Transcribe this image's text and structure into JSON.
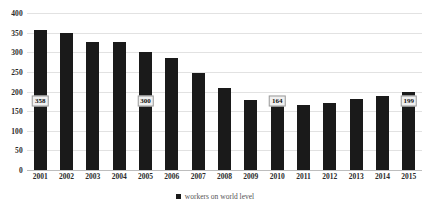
{
  "chart_data": {
    "type": "bar",
    "title": "",
    "subtitle": "",
    "xlabel": "",
    "ylabel": "",
    "ylim": [
      0,
      400
    ],
    "ytick_step": 50,
    "grid": true,
    "legend_position": "bottom-center",
    "categories": [
      "2001",
      "2002",
      "2003",
      "2004",
      "2005",
      "2006",
      "2007",
      "2008",
      "2009",
      "2010",
      "2011",
      "2012",
      "2013",
      "2014",
      "2015"
    ],
    "yticks": [
      "0",
      "50",
      "100",
      "150",
      "200",
      "250",
      "300",
      "350",
      "400"
    ],
    "series": [
      {
        "name": "workers on world level",
        "color": "#1a1a1a",
        "values": [
          358,
          350,
          327,
          325,
          300,
          285,
          246,
          210,
          178,
          164,
          166,
          172,
          182,
          188,
          199
        ]
      }
    ],
    "data_labels": [
      {
        "category": "2001",
        "value": 358,
        "text": "358"
      },
      {
        "category": "2005",
        "value": 300,
        "text": "300"
      },
      {
        "category": "2010",
        "value": 164,
        "text": "164"
      },
      {
        "category": "2015",
        "value": 199,
        "text": "199"
      }
    ],
    "legend": [
      {
        "label": "workers on world level",
        "color": "#1a1a1a"
      }
    ]
  },
  "legend": {
    "entry_label": "workers on world level"
  }
}
